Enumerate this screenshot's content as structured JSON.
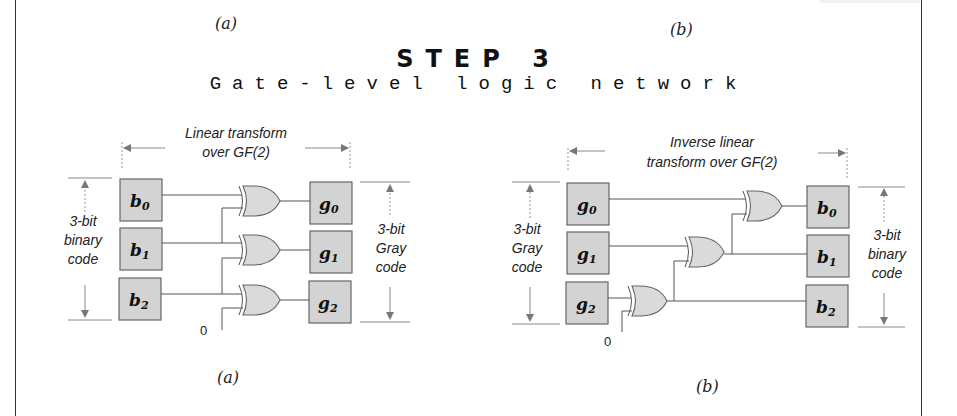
{
  "header": {
    "top_caption_a": "(a)",
    "top_caption_b": "(b)",
    "title": "STEP 3",
    "subtitle": "Gate-level logic network"
  },
  "diagram_a": {
    "caption": "(a)",
    "span_label_line1": "Linear transform",
    "span_label_line2": "over GF(2)",
    "left_label": [
      "3-bit",
      "binary",
      "code"
    ],
    "right_label": [
      "3-bit",
      "Gray",
      "code"
    ],
    "inputs": [
      {
        "base": "b",
        "sub": "0"
      },
      {
        "base": "b",
        "sub": "1"
      },
      {
        "base": "b",
        "sub": "2"
      }
    ],
    "outputs": [
      {
        "base": "g",
        "sub": "0"
      },
      {
        "base": "g",
        "sub": "1"
      },
      {
        "base": "g",
        "sub": "2"
      }
    ],
    "gate_type": "XOR",
    "constant_input": "0"
  },
  "diagram_b": {
    "caption": "(b)",
    "span_label_line1": "Inverse linear",
    "span_label_line2": "transform over GF(2)",
    "left_label": [
      "3-bit",
      "Gray",
      "code"
    ],
    "right_label": [
      "3-bit",
      "binary",
      "code"
    ],
    "inputs": [
      {
        "base": "g",
        "sub": "0"
      },
      {
        "base": "g",
        "sub": "1"
      },
      {
        "base": "g",
        "sub": "2"
      }
    ],
    "outputs": [
      {
        "base": "b",
        "sub": "0"
      },
      {
        "base": "b",
        "sub": "1"
      },
      {
        "base": "b",
        "sub": "2"
      }
    ],
    "gate_type": "XOR",
    "constant_input": "0"
  }
}
